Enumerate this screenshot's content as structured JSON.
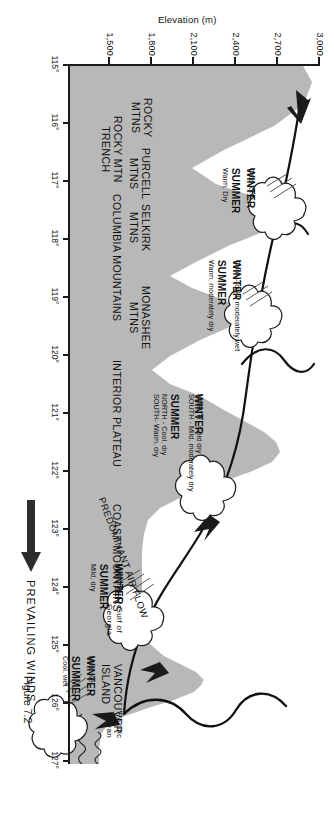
{
  "figure": {
    "caption": "Figure 7.2",
    "colors": {
      "land_fill": "#b8b8b8",
      "outline": "#1a1a1a",
      "background": "#ffffff",
      "arrow": "#262626"
    }
  },
  "axes": {
    "y": {
      "title": "Elevation (m)",
      "ticks": [
        "3,000",
        "2,700",
        "2,400",
        "2,100",
        "1,800",
        "1,500"
      ],
      "values": [
        3000,
        2700,
        2400,
        2100,
        1800,
        1500
      ]
    },
    "x": {
      "ticks": [
        "115°",
        "116°",
        "117°",
        "118°",
        "119°",
        "120°",
        "121°",
        "122°",
        "123°",
        "124°",
        "125°",
        "126°",
        "127°"
      ],
      "values": [
        115,
        116,
        117,
        118,
        119,
        120,
        121,
        122,
        123,
        124,
        125,
        126,
        127
      ]
    }
  },
  "wind": {
    "label": "PREVAILING WINDS",
    "airflow_label": "PREDOMINANT AIR FLOW"
  },
  "regions": [
    {
      "name": "pacific-ocean",
      "lines": [
        "Pacific",
        "Ocean"
      ]
    },
    {
      "name": "vancouver-island",
      "lines": [
        "VANCOUVER",
        "ISLAND"
      ]
    },
    {
      "name": "gulf-of-georgia",
      "lines": [
        "Gulf of",
        "Georgia"
      ]
    },
    {
      "name": "coast-mountains",
      "lines": [
        "COAST MOUNTAINS"
      ]
    },
    {
      "name": "interior-plateau",
      "lines": [
        "INTERIOR PLATEAU"
      ]
    },
    {
      "name": "monashee-mtns",
      "lines": [
        "MONASHEE",
        "MTNS"
      ]
    },
    {
      "name": "columbia-mountains",
      "lines": [
        "COLUMBIA MOUNTAINS"
      ]
    },
    {
      "name": "selkirk-mtns",
      "lines": [
        "SELKIRK",
        "MTNS"
      ]
    },
    {
      "name": "purcell-mtns",
      "lines": [
        "PURCELL",
        "MTNS"
      ]
    },
    {
      "name": "rocky-mtn-trench",
      "lines": [
        "ROCKY MTN",
        "TRENCH"
      ]
    },
    {
      "name": "rocky-mtns",
      "lines": [
        "ROCKY",
        "MTNS"
      ]
    }
  ],
  "climate_zones": [
    {
      "name": "pacific-coast",
      "winter_title": "WINTER",
      "winter_desc": "Mild, wet",
      "summer_title": "SUMMER",
      "summer_desc": "Cool, wet"
    },
    {
      "name": "gulf-of-georgia",
      "winter_title": "WINTER",
      "winter_desc": "Mild, moist",
      "summer_title": "SUMMER",
      "summer_desc": "Mild, dry"
    },
    {
      "name": "interior-plateau",
      "winter_title": "WINTER",
      "winter_desc": "NORTH - Cold dry\nSOUTH - Mild, moderately dry",
      "summer_title": "SUMMER",
      "summer_desc": "NORTH - Cool, dry\nSOUTH- Warm, dry"
    },
    {
      "name": "columbia-mountains",
      "winter_title": "WINTER",
      "winter_desc": "Cool— cold, moderately wet",
      "summer_title": "SUMMER",
      "summer_desc": "Warm, moderately dry"
    },
    {
      "name": "rocky-mountains",
      "winter_title": "WINTER",
      "winter_desc": "Cold, dry",
      "summer_title": "SUMMER",
      "summer_desc": "Warm, Dry"
    }
  ]
}
